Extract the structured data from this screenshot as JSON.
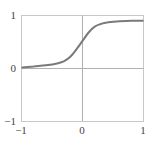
{
  "chart_data": {
    "type": "line",
    "title": "",
    "xlabel": "",
    "ylabel": "",
    "xlim": [
      -1,
      1
    ],
    "ylim": [
      -1,
      1
    ],
    "grid": false,
    "zero_lines": true,
    "x_ticks": [
      -1,
      0,
      1
    ],
    "y_ticks": [
      -1,
      0,
      1
    ],
    "x_tick_labels": [
      "−1",
      "0",
      "1"
    ],
    "y_tick_labels": [
      "−1",
      "0",
      "1"
    ],
    "series": [
      {
        "name": "sigmoid curve",
        "color": "#7a7a7a",
        "x": [
          -1.0,
          -0.8,
          -0.6,
          -0.4,
          -0.3,
          -0.2,
          -0.1,
          0.0,
          0.1,
          0.2,
          0.3,
          0.4,
          0.6,
          0.8,
          1.0
        ],
        "y": [
          0.02,
          0.04,
          0.06,
          0.1,
          0.14,
          0.22,
          0.36,
          0.52,
          0.68,
          0.79,
          0.84,
          0.87,
          0.89,
          0.9,
          0.9
        ]
      }
    ]
  },
  "colors": {
    "frame": "#c8c8c8",
    "axis_lines": "#b0b0b0",
    "curve": "#7a7a7a",
    "text": "#444444"
  }
}
